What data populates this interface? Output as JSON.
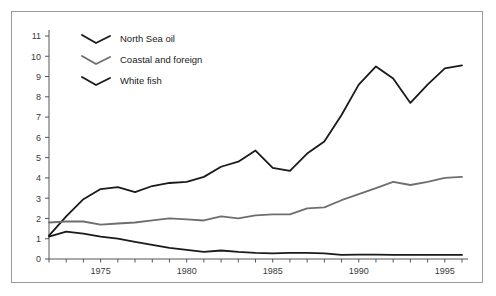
{
  "figure": {
    "background_color": "#ffffff",
    "frame_color": "#9a9a9a",
    "axis_color": "#555555"
  },
  "legend": {
    "position": "top-left-inside",
    "entries": [
      {
        "label": "North Sea  oil",
        "color": "#1a1a1a",
        "marker": "chevron-line"
      },
      {
        "label": "Coastal and foreign",
        "color": "#6e6e6e",
        "marker": "chevron-line"
      },
      {
        "label": "White fish",
        "color": "#1a1a1a",
        "marker": "chevron-line"
      }
    ]
  },
  "axes": {
    "y_ticks": [
      "0",
      "1",
      "2",
      "3",
      "4",
      "5",
      "6",
      "7",
      "8",
      "9",
      "10",
      "11"
    ],
    "x_ticks_labeled": [
      "1975",
      "1980",
      "1985",
      "1990",
      "1995"
    ]
  },
  "chart_data": {
    "type": "line",
    "title": "",
    "subtitle": "",
    "xlabel": "",
    "ylabel": "",
    "xlim": [
      1972,
      1996
    ],
    "ylim": [
      0,
      11
    ],
    "grid": false,
    "legend_position": "top-left-inside",
    "x": [
      1972,
      1973,
      1974,
      1975,
      1976,
      1977,
      1978,
      1979,
      1980,
      1981,
      1982,
      1983,
      1984,
      1985,
      1986,
      1987,
      1988,
      1989,
      1990,
      1991,
      1992,
      1993,
      1994,
      1995,
      1996
    ],
    "x_tick_labels": [
      "",
      "",
      "",
      "1975",
      "",
      "",
      "",
      "",
      "1980",
      "",
      "",
      "",
      "",
      "1985",
      "",
      "",
      "",
      "",
      "1990",
      "",
      "",
      "",
      "",
      "1995",
      ""
    ],
    "y_tick_values": [
      0,
      1,
      2,
      3,
      4,
      5,
      6,
      7,
      8,
      9,
      10,
      11
    ],
    "series": [
      {
        "name": "North Sea  oil",
        "color": "#1a1a1a",
        "width": 1.8,
        "values": [
          1.15,
          2.1,
          2.95,
          3.45,
          3.55,
          3.3,
          3.6,
          3.75,
          3.8,
          4.05,
          4.55,
          4.8,
          5.35,
          4.5,
          4.35,
          5.2,
          5.8,
          7.1,
          8.6,
          9.5,
          8.9,
          7.7,
          8.6,
          9.4,
          9.55
        ]
      },
      {
        "name": "Coastal and foreign",
        "color": "#6e6e6e",
        "width": 1.8,
        "values": [
          1.8,
          1.85,
          1.85,
          1.7,
          1.75,
          1.8,
          1.9,
          2.0,
          1.95,
          1.9,
          2.1,
          2.0,
          2.15,
          2.2,
          2.2,
          2.5,
          2.55,
          2.9,
          3.2,
          3.5,
          3.8,
          3.65,
          3.8,
          4.0,
          4.05
        ]
      },
      {
        "name": "White fish",
        "color": "#1a1a1a",
        "width": 1.8,
        "values": [
          1.1,
          1.35,
          1.25,
          1.1,
          1.0,
          0.85,
          0.7,
          0.55,
          0.45,
          0.35,
          0.42,
          0.35,
          0.3,
          0.28,
          0.3,
          0.3,
          0.28,
          0.2,
          0.22,
          0.22,
          0.2,
          0.2,
          0.2,
          0.2,
          0.2
        ]
      }
    ]
  }
}
